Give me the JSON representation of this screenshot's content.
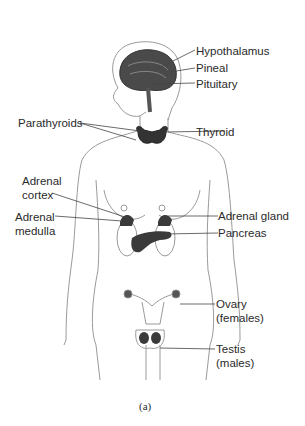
{
  "figure": {
    "caption": "(a)",
    "labels": {
      "hypothalamus": "Hypothalamus",
      "pineal": "Pineal",
      "pituitary": "Pituitary",
      "parathyroids": "Parathyroids",
      "thyroid": "Thyroid",
      "adrenal_cortex_1": "Adrenal",
      "adrenal_cortex_2": "cortex",
      "adrenal_medulla_1": "Adrenal",
      "adrenal_medulla_2": "medulla",
      "adrenal_gland": "Adrenal gland",
      "pancreas": "Pancreas",
      "ovary_1": "Ovary",
      "ovary_2": "(females)",
      "testis_1": "Testis",
      "testis_2": "(males)"
    },
    "colors": {
      "outline": "#8a8a8a",
      "gland": "#3a3a3a",
      "leader": "#444444"
    }
  }
}
